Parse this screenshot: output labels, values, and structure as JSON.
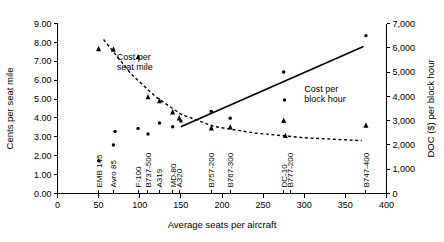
{
  "chart_data": {
    "type": "scatter",
    "title": "",
    "xlabel": "Average seats per aircraft",
    "ylabel": "Cents per seat mile",
    "y2label": "DOC ($) per block hour",
    "xlim": [
      0,
      400
    ],
    "ylim": [
      0,
      9
    ],
    "y2lim": [
      0,
      7000
    ],
    "grid": false,
    "legend_position": "inline-annotation",
    "xticks": [
      "0",
      "50",
      "100",
      "150",
      "200",
      "250",
      "300",
      "350",
      "400"
    ],
    "xtick_values": [
      0,
      50,
      100,
      150,
      200,
      250,
      300,
      350,
      400
    ],
    "yticks": [
      "0.00",
      "1.00",
      "2.00",
      "3.00",
      "4.00",
      "5.00",
      "6.00",
      "7.00",
      "8.00",
      "9.00"
    ],
    "ytick_values": [
      0,
      1,
      2,
      3,
      4,
      5,
      6,
      7,
      8,
      9
    ],
    "y2ticks": [
      "0",
      "1,000",
      "2,000",
      "3,000",
      "4,000",
      "5,000",
      "6,000",
      "7,000"
    ],
    "y2tick_values": [
      0,
      1000,
      2000,
      3000,
      4000,
      5000,
      6000,
      7000
    ],
    "annotations": [
      {
        "text": "Cost per seat mile",
        "line1": "Cost per",
        "line2": "seat mile",
        "x": 72,
        "y": 7.05
      },
      {
        "text": "Cost per block hour",
        "line1": "Cost per",
        "line2": "block hour",
        "x": 300,
        "y": 5.35
      }
    ],
    "aircraft_labels": [
      {
        "name": "EMB 145",
        "seats": 50
      },
      {
        "name": "Avro 85",
        "seats": 68
      },
      {
        "name": "F-100",
        "seats": 98
      },
      {
        "name": "B737-500",
        "seats": 110
      },
      {
        "name": "A319",
        "seats": 124
      },
      {
        "name": "MD-80",
        "seats": 140
      },
      {
        "name": "A320",
        "seats": 148
      },
      {
        "name": "B757-200",
        "seats": 187
      },
      {
        "name": "B767-300",
        "seats": 210
      },
      {
        "name": "DC-10",
        "seats": 275
      },
      {
        "name": "B777-200",
        "seats": 283
      },
      {
        "name": "B747-400",
        "seats": 375
      }
    ],
    "series": [
      {
        "name": "Cost per seat mile",
        "marker": "triangle",
        "axis": "left",
        "unit": "cents per seat mile",
        "points": [
          {
            "aircraft": "EMB 145",
            "x": 50,
            "y": 7.65
          },
          {
            "aircraft": "Avro 85",
            "x": 68,
            "y": 7.62
          },
          {
            "aircraft": "F-100",
            "x": 98,
            "y": 7.22
          },
          {
            "aircraft": "B737-500",
            "x": 110,
            "y": 5.1
          },
          {
            "aircraft": "A319",
            "x": 124,
            "y": 4.9
          },
          {
            "aircraft": "MD-80",
            "x": 140,
            "y": 4.3
          },
          {
            "aircraft": "A320",
            "x": 148,
            "y": 3.98
          },
          {
            "aircraft": "B757-200",
            "x": 187,
            "y": 3.45
          },
          {
            "aircraft": "B767-300",
            "x": 210,
            "y": 3.5
          },
          {
            "aircraft": "DC-10",
            "x": 275,
            "y": 3.85
          },
          {
            "aircraft": "B777-200",
            "x": 277,
            "y": 3.05
          },
          {
            "aircraft": "B747-400",
            "x": 375,
            "y": 3.6
          }
        ]
      },
      {
        "name": "Cost per block hour",
        "marker": "dot",
        "axis": "right",
        "unit": "DOC ($) per block hour",
        "points": [
          {
            "aircraft": "EMB 145",
            "x": 50,
            "y": 1350
          },
          {
            "aircraft": "Avro 85",
            "x": 68,
            "y": 2000
          },
          {
            "aircraft": "F-100",
            "x": 70,
            "y": 2550
          },
          {
            "aircraft": "B737-500",
            "x": 98,
            "y": 2680
          },
          {
            "aircraft": "A319",
            "x": 110,
            "y": 2450
          },
          {
            "aircraft": "MD-80",
            "x": 124,
            "y": 2900
          },
          {
            "aircraft": "A320",
            "x": 140,
            "y": 2750
          },
          {
            "aircraft": "B757-200",
            "x": 150,
            "y": 2980
          },
          {
            "aircraft": "B767-300",
            "x": 187,
            "y": 3380
          },
          {
            "aircraft": "DC-10",
            "x": 210,
            "y": 3100
          },
          {
            "aircraft": "B777-200",
            "x": 275,
            "y": 5000
          },
          {
            "aircraft": "B777-200b",
            "x": 276,
            "y": 3850
          },
          {
            "aircraft": "B747-400",
            "x": 375,
            "y": 6500
          }
        ]
      }
    ],
    "trendlines": [
      {
        "name": "Cost per block hour trend",
        "style": "solid",
        "axis": "right",
        "x1": 150,
        "y1": 2750,
        "x2": 372,
        "y2": 6050
      },
      {
        "name": "Cost per seat mile trend",
        "style": "dashed",
        "axis": "left",
        "points": [
          {
            "x": 56,
            "y": 8.15
          },
          {
            "x": 90,
            "y": 6.3
          },
          {
            "x": 120,
            "y": 5.1
          },
          {
            "x": 150,
            "y": 4.2
          },
          {
            "x": 190,
            "y": 3.55
          },
          {
            "x": 240,
            "y": 3.2
          },
          {
            "x": 300,
            "y": 2.95
          },
          {
            "x": 370,
            "y": 2.8
          }
        ]
      }
    ]
  }
}
